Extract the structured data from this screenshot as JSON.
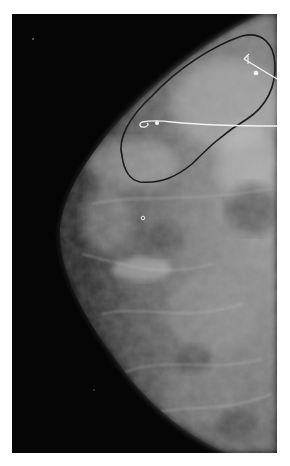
{
  "image": {
    "type": "mammogram",
    "background_color": "#050505",
    "page_color": "#ffffff",
    "frame": {
      "x": 12,
      "y": 14,
      "width": 265,
      "height": 439
    }
  },
  "annotations": {
    "outline": {
      "description": "hand-drawn dark contour enclosing upper-outer region",
      "color": "#1a1a1a"
    },
    "wire_upper": {
      "description": "localization wire with hook, upper right",
      "color": "#f2f2f2"
    },
    "wire_middle": {
      "description": "localization wire with curled hook tip, horizontal",
      "color": "#f2f2f2"
    },
    "marker_dots": [
      {
        "x": 256,
        "y": 73
      },
      {
        "x": 157,
        "y": 123
      }
    ],
    "calcification": {
      "x": 143,
      "y": 218
    }
  }
}
